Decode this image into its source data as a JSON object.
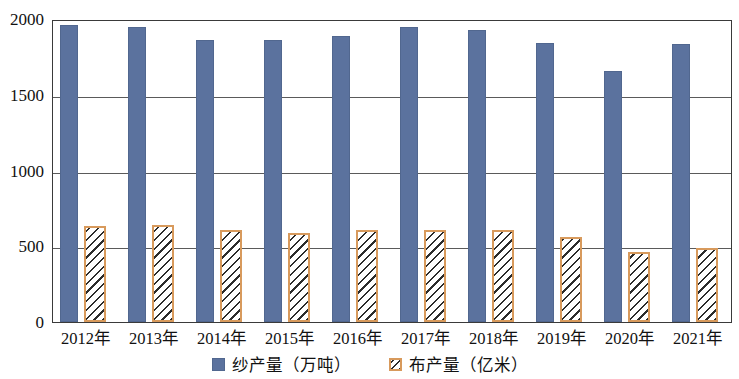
{
  "chart_data": {
    "type": "bar",
    "title": "",
    "subtitle": "",
    "xlabel": "",
    "ylabel": "",
    "ylim": [
      0,
      2000
    ],
    "yticks": [
      0,
      500,
      1000,
      1500,
      2000
    ],
    "ytick_labels": [
      "0",
      "500",
      "1000",
      "1500",
      "2000"
    ],
    "grid": true,
    "legend_position": "bottom-center",
    "categories": [
      "2012年",
      "2013年",
      "2014年",
      "2015年",
      "2016年",
      "2017年",
      "2018年",
      "2019年",
      "2020年",
      "2021年"
    ],
    "series": [
      {
        "name": "纱产量（万吨）",
        "color": "#5b729e",
        "pattern": "solid",
        "values": [
          1960,
          1950,
          1860,
          1860,
          1890,
          1945,
          1925,
          1840,
          1660,
          1835
        ]
      },
      {
        "name": "布产量（亿米）",
        "color": "#d89a5c",
        "pattern": "diagonal-hatch",
        "values": [
          635,
          640,
          605,
          585,
          610,
          610,
          605,
          560,
          465,
          490
        ]
      }
    ]
  },
  "legend": {
    "items": [
      {
        "label": "纱产量（万吨）",
        "swatch": "solid-blue-square-icon"
      },
      {
        "label": "布产量（亿米）",
        "swatch": "hatched-orange-square-icon"
      }
    ]
  }
}
